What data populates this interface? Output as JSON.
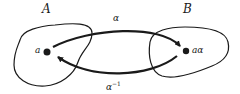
{
  "diagram": {
    "sets": [
      {
        "id": "A",
        "label": "A"
      },
      {
        "id": "B",
        "label": "B"
      }
    ],
    "points": [
      {
        "id": "a",
        "label": "a",
        "in_set": "A"
      },
      {
        "id": "a_alpha",
        "label": "aα",
        "in_set": "B"
      }
    ],
    "arrows": [
      {
        "from": "a",
        "to": "a_alpha",
        "label": "α",
        "direction": "upper"
      },
      {
        "from": "a_alpha",
        "to": "a",
        "label_base": "α",
        "label_exponent": "−1",
        "direction": "lower"
      }
    ],
    "colors": {
      "stroke": "#1a1a1a",
      "background": "#ffffff"
    }
  }
}
